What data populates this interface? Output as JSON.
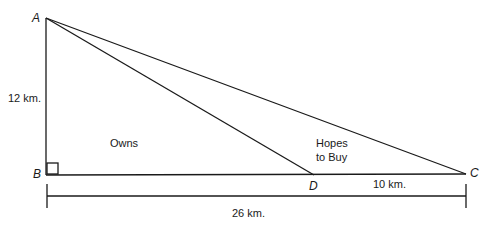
{
  "diagram": {
    "points": {
      "A": {
        "label": "A",
        "x": 46,
        "y": 18
      },
      "B": {
        "label": "B",
        "x": 46,
        "y": 175
      },
      "C": {
        "label": "C",
        "x": 466,
        "y": 174
      },
      "D": {
        "label": "D",
        "x": 314,
        "y": 175
      }
    },
    "labels": {
      "ab_length": "12 km.",
      "dc_length": "10 km.",
      "bc_length": "26 km.",
      "region_owns": "Owns",
      "region_hopes_line1": "Hopes",
      "region_hopes_line2": "to Buy"
    },
    "colors": {
      "line": "#1a1a1a",
      "background": "#ffffff"
    }
  }
}
